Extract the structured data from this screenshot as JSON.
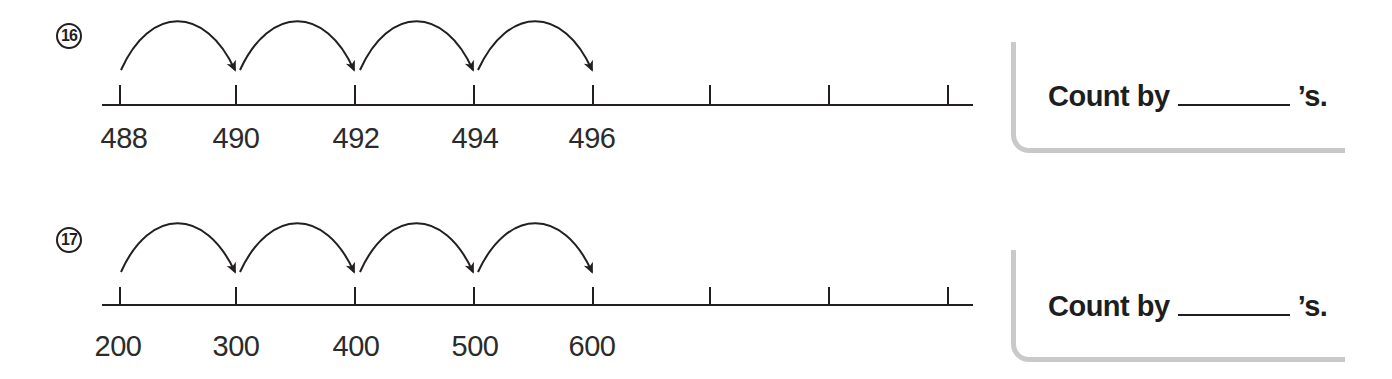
{
  "problems": [
    {
      "number": "16",
      "circled_label": "⑯",
      "ticks": [
        "488",
        "490",
        "492",
        "494",
        "496",
        "",
        "",
        ""
      ],
      "hops": 4,
      "prompt_before": "Count by",
      "prompt_after": "’s.",
      "answer": ""
    },
    {
      "number": "17",
      "circled_label": "⑰",
      "ticks": [
        "200",
        "300",
        "400",
        "500",
        "600",
        "",
        "",
        ""
      ],
      "hops": 4,
      "prompt_before": "Count by",
      "prompt_after": "’s.",
      "answer": ""
    }
  ],
  "colors": {
    "ink": "#231f20",
    "box_border": "#c9c9c9"
  }
}
